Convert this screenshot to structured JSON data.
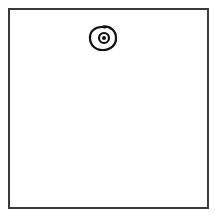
{
  "canvas": {
    "background": "#ffffff",
    "border_color": "#3a3a3a"
  },
  "sketch": {
    "subject": "eye-icon",
    "stroke_color": "#111111",
    "outer_ring": {
      "cx": 103,
      "cy": 38,
      "rx": 13,
      "ry": 12
    },
    "inner_ring": {
      "cx": 104,
      "cy": 38,
      "r": 5
    },
    "pupil": {
      "cx": 104,
      "cy": 38,
      "r": 2
    }
  }
}
